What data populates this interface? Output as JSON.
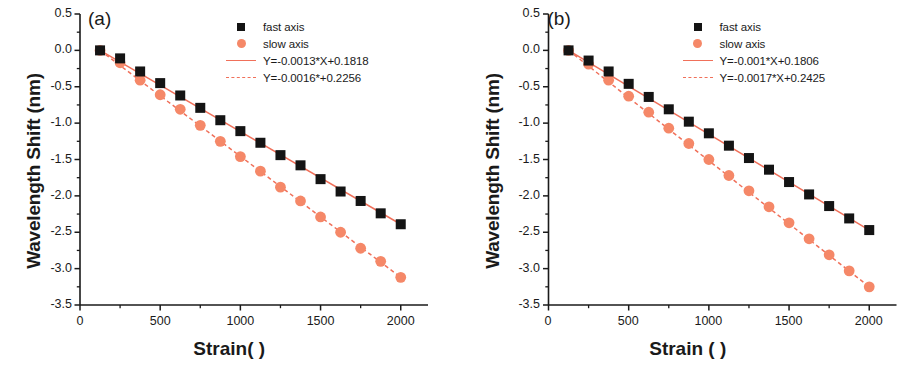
{
  "figure": {
    "panels": [
      {
        "tag": "(a)",
        "ylabel": "Wavelength Shift (nm)",
        "xlabel": "Strain(  )",
        "legend": [
          {
            "key": "square-marker",
            "label": "fast axis"
          },
          {
            "key": "circle-marker",
            "label": "slow axis"
          },
          {
            "key": "solid-line",
            "label": "Y=-0.0013*X+0.1818"
          },
          {
            "key": "dashed-line",
            "label": "Y=-0.0016*+0.2256"
          }
        ]
      },
      {
        "tag": "(b)",
        "ylabel": "Wavelength Shift (nm)",
        "xlabel": "Strain (  )",
        "legend": [
          {
            "key": "square-marker",
            "label": "fast axis"
          },
          {
            "key": "circle-marker",
            "label": "slow axis"
          },
          {
            "key": "solid-line",
            "label": "Y=-0.001*X+0.1806"
          },
          {
            "key": "dashed-line",
            "label": "Y=-0.0017*X+0.2425"
          }
        ]
      }
    ]
  },
  "colors": {
    "fast_marker": "#141414",
    "slow_marker": "#f58868",
    "fit_line": "#f0705a",
    "axis": "#1a1a1a"
  },
  "chart_data": [
    {
      "type": "scatter",
      "title": "(a)",
      "xlabel": "Strain(  )",
      "ylabel": "Wavelength Shift (nm)",
      "xlim": [
        0,
        2170
      ],
      "ylim": [
        -3.5,
        0.5
      ],
      "xticks": [
        0,
        500,
        1000,
        1500,
        2000
      ],
      "yticks": [
        0.5,
        0.0,
        -0.5,
        -1.0,
        -1.5,
        -2.0,
        -2.5,
        -3.0,
        -3.5
      ],
      "xtick_labels": [
        "0",
        "500",
        "1000",
        "1500",
        "2000"
      ],
      "ytick_labels": [
        "0.5",
        "0.0",
        "-0.5",
        "-1.0",
        "-1.5",
        "-2.0",
        "-2.5",
        "-3.0",
        "-3.5"
      ],
      "minor_ticks": true,
      "grid": false,
      "legend_position": "upper right",
      "x": [
        125,
        250,
        375,
        500,
        625,
        750,
        875,
        1000,
        1125,
        1250,
        1375,
        1500,
        1625,
        1750,
        1875,
        2000
      ],
      "series": [
        {
          "name": "fast axis",
          "marker": "square",
          "color": "#141414",
          "values": [
            0.0,
            -0.11,
            -0.29,
            -0.45,
            -0.62,
            -0.79,
            -0.96,
            -1.11,
            -1.27,
            -1.44,
            -1.58,
            -1.77,
            -1.94,
            -2.07,
            -2.24,
            -2.39
          ]
        },
        {
          "name": "slow axis",
          "marker": "circle",
          "color": "#f58868",
          "values": [
            0.0,
            -0.17,
            -0.41,
            -0.61,
            -0.81,
            -1.03,
            -1.25,
            -1.46,
            -1.66,
            -1.88,
            -2.07,
            -2.29,
            -2.5,
            -2.72,
            -2.9,
            -3.12
          ]
        }
      ],
      "fits": [
        {
          "name": "fast axis fit",
          "label": "Y=-0.0013*X+0.1818",
          "style": "solid",
          "color": "#f0705a",
          "slope": -0.0013,
          "intercept": 0.1818
        },
        {
          "name": "slow axis fit",
          "label": "Y=-0.0016*+0.2256",
          "style": "dashed",
          "color": "#f0705a",
          "slope": -0.0016,
          "intercept": 0.2256
        }
      ]
    },
    {
      "type": "scatter",
      "title": "(b)",
      "xlabel": "Strain (  )",
      "ylabel": "Wavelength Shift (nm)",
      "xlim": [
        0,
        2170
      ],
      "ylim": [
        -3.5,
        0.5
      ],
      "xticks": [
        0,
        500,
        1000,
        1500,
        2000
      ],
      "yticks": [
        0.5,
        0.0,
        -0.5,
        -1.0,
        -1.5,
        -2.0,
        -2.5,
        -3.0,
        -3.5
      ],
      "xtick_labels": [
        "0",
        "500",
        "1000",
        "1500",
        "2000"
      ],
      "ytick_labels": [
        "0.5",
        "0.0",
        "-0.5",
        "-1.0",
        "-1.5",
        "-2.0",
        "-2.5",
        "-3.0",
        "-3.5"
      ],
      "minor_ticks": true,
      "grid": false,
      "legend_position": "upper right",
      "x": [
        125,
        250,
        375,
        500,
        625,
        750,
        875,
        1000,
        1125,
        1250,
        1375,
        1500,
        1625,
        1750,
        1875,
        2000
      ],
      "series": [
        {
          "name": "fast axis",
          "marker": "square",
          "color": "#141414",
          "values": [
            0.0,
            -0.14,
            -0.29,
            -0.46,
            -0.64,
            -0.81,
            -0.98,
            -1.14,
            -1.31,
            -1.48,
            -1.64,
            -1.81,
            -1.98,
            -2.14,
            -2.31,
            -2.47
          ]
        },
        {
          "name": "slow axis",
          "marker": "circle",
          "color": "#f58868",
          "values": [
            0.0,
            -0.19,
            -0.41,
            -0.63,
            -0.85,
            -1.07,
            -1.28,
            -1.5,
            -1.72,
            -1.93,
            -2.15,
            -2.37,
            -2.59,
            -2.81,
            -3.03,
            -3.25
          ]
        }
      ],
      "fits": [
        {
          "name": "fast axis fit",
          "label": "Y=-0.001*X+0.1806",
          "style": "solid",
          "color": "#f0705a",
          "slope": -0.001,
          "intercept": 0.1806
        },
        {
          "name": "slow axis fit",
          "label": "Y=-0.0017*X+0.2425",
          "style": "dashed",
          "color": "#f0705a",
          "slope": -0.0017,
          "intercept": 0.2425
        }
      ]
    }
  ]
}
